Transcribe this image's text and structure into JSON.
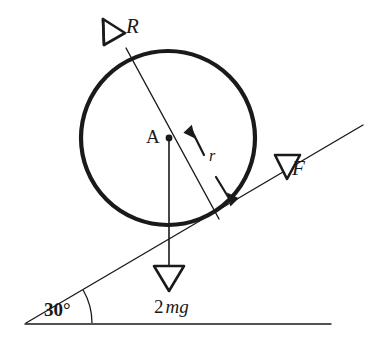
{
  "figure": {
    "background_color": "#ffffff",
    "ink_color": "#1a1a1a",
    "width": 391,
    "height": 338
  },
  "labels": {
    "normal_force": "R",
    "applied_force": "F",
    "center_point": "A",
    "radius": "r",
    "weight_coefficient": "2",
    "weight_symbol": "mg",
    "weight_full": "2mg",
    "incline_angle": "30°"
  },
  "icons": {
    "normal_arrowhead": "open-triangle-arrowhead-up-right",
    "force_arrowhead": "open-triangle-arrowhead-down-left",
    "weight_arrowhead": "open-triangle-arrowhead-down",
    "radius_arrowhead_inner": "solid-arrowhead-up-left",
    "radius_arrowhead_outer": "solid-arrowhead-down-right",
    "center_marker": "filled-dot",
    "angle_marker": "arc"
  },
  "geometry": {
    "circle": {
      "cx": 168,
      "cy": 138,
      "r": 87,
      "stroke_width": 4.2
    },
    "center_dot_radius": 3.4,
    "incline": {
      "x1": 26,
      "y1": 323,
      "x2": 363,
      "y2": 125,
      "stroke_width": 1.4
    },
    "ground": {
      "x1": 25,
      "y1": 324,
      "x2": 331,
      "y2": 324,
      "stroke_width": 1.4
    },
    "normal_line": {
      "x1": 123,
      "y1": 41,
      "x2": 219,
      "y2": 219,
      "stroke_width": 1.4
    },
    "weight_line": {
      "x1": 169,
      "y1": 138,
      "x2": 169,
      "y2": 272,
      "stroke_width": 1.6
    },
    "angle_arc": {
      "cx": 26,
      "cy": 323,
      "radius": 66,
      "start_deg": 0,
      "end_deg": 30
    }
  },
  "annotations": {
    "note_normal": "Normal reaction R acts perpendicular to the inclined surface through the centre A.",
    "note_force": "Applied force F acts up the incline, parallel to the surface.",
    "note_weight": "Weight 2mg acts vertically downward from the centre A.",
    "note_radius": "r marks the radius from centre A to the point of contact."
  }
}
